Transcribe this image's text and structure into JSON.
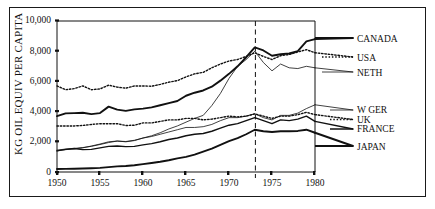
{
  "chart_data": {
    "type": "line",
    "title": "",
    "xlabel": "",
    "ylabel": "KG OIL EQUIV PER CAPITA",
    "xlim": [
      1950,
      1980
    ],
    "ylim": [
      0,
      10000
    ],
    "grid": false,
    "legend_position": "right",
    "xticks": [
      "1950",
      "1955",
      "1960",
      "1965",
      "1970",
      "1975",
      "1980"
    ],
    "xtick_values": [
      1950,
      1955,
      1960,
      1965,
      1970,
      1975,
      1980
    ],
    "yticks": [
      "0",
      "2,000",
      "4,000",
      "6,000",
      "8,000",
      "10,000"
    ],
    "ytick_values": [
      0,
      2000,
      4000,
      6000,
      8000,
      10000
    ],
    "annotations": [
      {
        "name": "oil-crisis-marker",
        "type": "vertical-dashed-line",
        "x": 1973,
        "label": ""
      }
    ],
    "x": [
      1950,
      1951,
      1952,
      1953,
      1954,
      1955,
      1956,
      1957,
      1958,
      1959,
      1960,
      1961,
      1962,
      1963,
      1964,
      1965,
      1966,
      1967,
      1968,
      1969,
      1970,
      1971,
      1972,
      1973,
      1974,
      1975,
      1976,
      1977,
      1978,
      1979,
      1980
    ],
    "series": [
      {
        "name": "CANADA",
        "style": "solid-thick",
        "values": [
          3700,
          3880,
          3900,
          3920,
          3830,
          3900,
          4330,
          4130,
          4050,
          4150,
          4200,
          4280,
          4420,
          4560,
          4700,
          5050,
          5250,
          5400,
          5650,
          6050,
          6500,
          7000,
          7600,
          8250,
          8050,
          7700,
          7800,
          7850,
          8000,
          8650,
          8800
        ]
      },
      {
        "name": "USA",
        "style": "dotted",
        "values": [
          5700,
          5450,
          5520,
          5700,
          5450,
          5500,
          5750,
          5620,
          5550,
          5700,
          5700,
          5680,
          5800,
          5950,
          6050,
          6300,
          6500,
          6600,
          6900,
          7150,
          7350,
          7450,
          7650,
          7900,
          7650,
          7450,
          7700,
          7780,
          7950,
          8100,
          7900
        ]
      },
      {
        "name": "NETH",
        "style": "solid-thin",
        "values": [
          1400,
          1480,
          1530,
          1600,
          1720,
          1850,
          2000,
          2050,
          2000,
          2080,
          2250,
          2400,
          2600,
          2850,
          3050,
          3300,
          3550,
          3750,
          4400,
          5200,
          6200,
          7000,
          7450,
          8000,
          7250,
          6700,
          7150,
          6900,
          6850,
          7000,
          6900
        ]
      },
      {
        "name": "W GER",
        "style": "solid-thin",
        "values": [
          1450,
          1520,
          1560,
          1620,
          1700,
          1820,
          1950,
          2050,
          2020,
          2100,
          2250,
          2350,
          2500,
          2650,
          2800,
          2950,
          2950,
          3000,
          3150,
          3400,
          3600,
          3600,
          3700,
          3850,
          3600,
          3450,
          3750,
          3750,
          3900,
          4200,
          4450
        ]
      },
      {
        "name": "UK",
        "style": "dotted",
        "values": [
          3050,
          3050,
          3050,
          3080,
          3150,
          3200,
          3200,
          3200,
          3080,
          3100,
          3250,
          3250,
          3350,
          3450,
          3450,
          3550,
          3550,
          3450,
          3500,
          3600,
          3700,
          3650,
          3700,
          3850,
          3700,
          3550,
          3700,
          3700,
          3800,
          3950,
          3800
        ]
      },
      {
        "name": "FRANCE",
        "style": "solid-medium",
        "values": [
          1400,
          1500,
          1560,
          1480,
          1500,
          1600,
          1700,
          1720,
          1680,
          1700,
          1800,
          1880,
          2000,
          2150,
          2250,
          2400,
          2500,
          2550,
          2700,
          2900,
          3100,
          3200,
          3400,
          3600,
          3400,
          3200,
          3450,
          3400,
          3500,
          3700,
          3350
        ]
      },
      {
        "name": "JAPAN",
        "style": "solid-thick",
        "values": [
          200,
          210,
          220,
          230,
          250,
          270,
          320,
          370,
          400,
          450,
          520,
          600,
          680,
          780,
          900,
          1000,
          1150,
          1350,
          1550,
          1800,
          2050,
          2250,
          2500,
          2800,
          2700,
          2650,
          2700,
          2700,
          2720,
          2800,
          2600
        ]
      }
    ],
    "legend_entries": [
      {
        "label": "CANADA",
        "style": "solid-thick"
      },
      {
        "label": "USA",
        "style": "dotted"
      },
      {
        "label": "NETH",
        "style": "solid-thin"
      },
      {
        "label": "W GER",
        "style": "solid-thin"
      },
      {
        "label": "UK",
        "style": "dotted"
      },
      {
        "label": "FRANCE",
        "style": "solid-medium"
      },
      {
        "label": "JAPAN",
        "style": "solid-thick"
      }
    ]
  },
  "colors": {
    "ink": "#111111",
    "background": "#ffffff",
    "frame": "#1a1a1a"
  }
}
